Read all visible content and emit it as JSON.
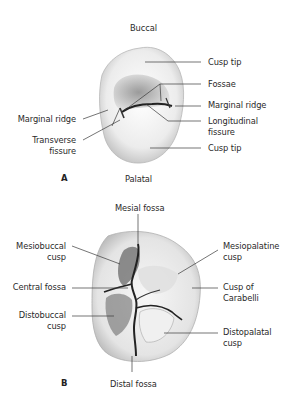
{
  "figure_a": {
    "panel_letter": "A",
    "orientation_top": "Buccal",
    "orientation_bottom": "Palatal",
    "labels": {
      "cusp_tip_top": "Cusp tip",
      "fossae": "Fossae",
      "marginal_ridge_right": "Marginal ridge",
      "longitudinal_fissure_1": "Longitudinal",
      "longitudinal_fissure_2": "fissure",
      "cusp_tip_bottom": "Cusp tip",
      "marginal_ridge_left": "Marginal ridge",
      "transverse_fissure_1": "Transverse",
      "transverse_fissure_2": "fissure"
    }
  },
  "figure_b": {
    "panel_letter": "B",
    "labels": {
      "mesial_fossa": "Mesial fossa",
      "mesiobuccal_cusp_1": "Mesiobuccal",
      "mesiobuccal_cusp_2": "cusp",
      "central_fossa": "Central fossa",
      "distobuccal_cusp_1": "Distobuccal",
      "distobuccal_cusp_2": "cusp",
      "mesiopalatine_cusp_1": "Mesiopalatine",
      "mesiopalatine_cusp_2": "cusp",
      "cusp_of_carabelli_1": "Cusp of",
      "cusp_of_carabelli_2": "Carabelli",
      "distopalatal_cusp_1": "Distopalatal",
      "distopalatal_cusp_2": "cusp",
      "distal_fossa": "Distal fossa"
    }
  },
  "colors": {
    "line": "#3a3a3a",
    "tooth_light": "#f4f4f4",
    "tooth_mid": "#cfcfcf",
    "tooth_dark": "#555555"
  }
}
